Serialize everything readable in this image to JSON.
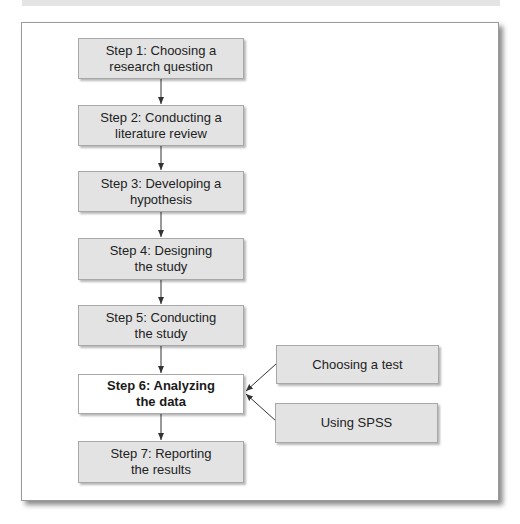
{
  "diagram": {
    "type": "flowchart",
    "steps": [
      {
        "label": "Step 1: Choosing a\nresearch question"
      },
      {
        "label": "Step 2: Conducting a\nliterature review"
      },
      {
        "label": "Step 3: Developing a\nhypothesis"
      },
      {
        "label": "Step 4: Designing\nthe study"
      },
      {
        "label": "Step 5: Conducting\nthe study"
      },
      {
        "label": "Step 6: Analyzing\nthe data",
        "highlighted": true
      },
      {
        "label": "Step 7: Reporting\nthe results"
      }
    ],
    "side_inputs": [
      {
        "label": "Choosing a test",
        "target": "Step 6"
      },
      {
        "label": "Using SPSS",
        "target": "Step 6"
      }
    ],
    "colors": {
      "box_fill": "#e3e3e3",
      "highlight_fill": "#ffffff",
      "border": "#a8a8a8",
      "arrow": "#333333"
    }
  }
}
